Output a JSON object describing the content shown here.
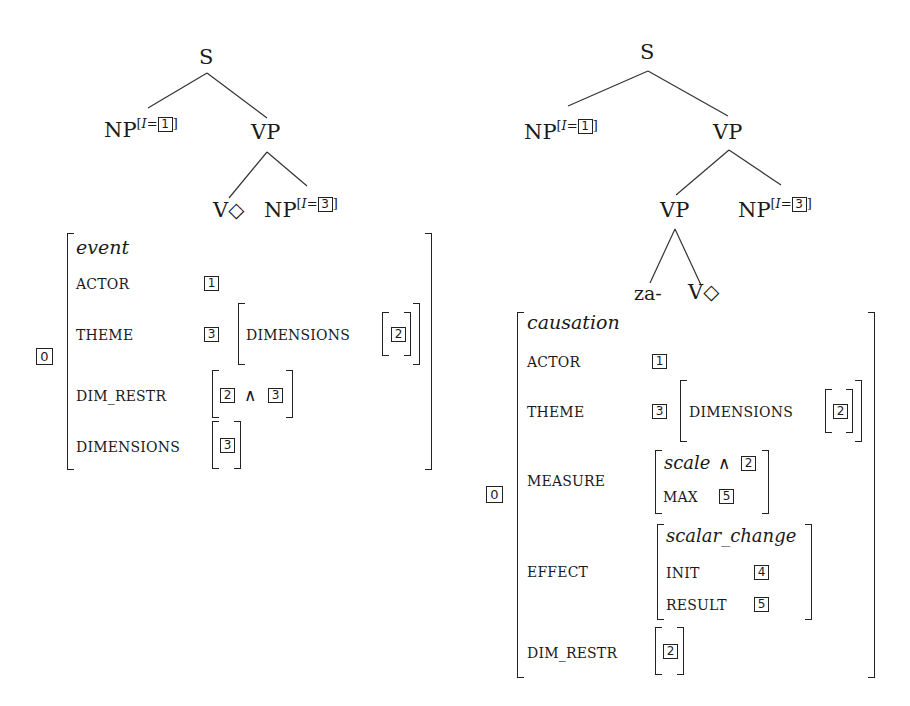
{
  "left": {
    "tree": {
      "root": "S",
      "np_subject": {
        "label": "NP",
        "index_attr": "I",
        "tag": "1"
      },
      "vp": "VP",
      "verb": "V◇",
      "np_object": {
        "label": "NP",
        "index_attr": "I",
        "tag": "3"
      }
    },
    "avm": {
      "tag": "0",
      "type": "event",
      "rows": [
        {
          "feature": "ACTOR",
          "value_tag": "1"
        },
        {
          "feature": "THEME",
          "value_tag": "3",
          "inner_feature": "DIMENSIONS",
          "inner_tag": "2"
        },
        {
          "feature": "DIM_RESTR",
          "value_tag_a": "2",
          "operator": "∧",
          "value_tag_b": "3"
        },
        {
          "feature": "DIMENSIONS",
          "value_tag": "3"
        }
      ]
    }
  },
  "right": {
    "tree": {
      "root": "S",
      "np_subject": {
        "label": "NP",
        "index_attr": "I",
        "tag": "1"
      },
      "vp": "VP",
      "vp_inner": "VP",
      "np_object": {
        "label": "NP",
        "index_attr": "I",
        "tag": "3"
      },
      "prefix": "za-",
      "verb": "V◇"
    },
    "avm": {
      "tag": "0",
      "type": "causation",
      "rows": [
        {
          "feature": "ACTOR",
          "value_tag": "1"
        },
        {
          "feature": "THEME",
          "value_tag": "3",
          "inner_feature": "DIMENSIONS",
          "inner_tag": "2"
        },
        {
          "feature": "MEASURE",
          "scale_type": "scale",
          "operator": "∧",
          "scale_tag": "2",
          "max_feature": "MAX",
          "max_tag": "5"
        },
        {
          "feature": "EFFECT",
          "effect_type": "scalar_change",
          "init_feature": "INIT",
          "init_tag": "4",
          "result_feature": "RESULT",
          "result_tag": "5"
        },
        {
          "feature": "DIM_RESTR",
          "value_tag": "2"
        }
      ]
    }
  }
}
